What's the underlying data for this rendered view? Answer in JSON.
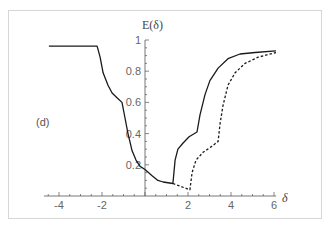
{
  "chart_data": {
    "type": "line",
    "title": "",
    "panel_label": "(d)",
    "xlabel": "δ",
    "ylabel": "E(δ)",
    "xlim": [
      -4.7,
      6.1
    ],
    "ylim": [
      0,
      1
    ],
    "grid": false,
    "legend": null,
    "x_ticks": [
      -4,
      -2,
      2,
      4,
      6
    ],
    "x_tick_labels": [
      "-4",
      "-2",
      "2",
      "4",
      "6"
    ],
    "y_ticks": [
      0.2,
      0.4,
      0.6,
      0.8,
      1
    ],
    "y_tick_labels": [
      "0.2",
      "0.4",
      "0.6",
      "0.8",
      "1"
    ],
    "series": [
      {
        "name": "solid",
        "style": "solid",
        "color": "#1a1a1a",
        "x": [
          -4.47,
          -2.23,
          -2.09,
          -1.95,
          -1.72,
          -1.53,
          -1.3,
          -1.07,
          -0.93,
          -0.79,
          -0.6,
          -0.42,
          -0.23,
          0.0,
          0.33,
          0.6,
          0.84,
          1.3,
          1.4,
          1.53,
          1.77,
          2.05,
          2.42,
          2.56,
          2.79,
          3.02,
          3.4,
          3.86,
          4.42,
          5.12,
          6.09
        ],
        "y": [
          0.96,
          0.96,
          0.89,
          0.79,
          0.71,
          0.66,
          0.63,
          0.6,
          0.5,
          0.4,
          0.29,
          0.23,
          0.19,
          0.17,
          0.13,
          0.1,
          0.09,
          0.08,
          0.23,
          0.3,
          0.34,
          0.38,
          0.41,
          0.52,
          0.65,
          0.74,
          0.82,
          0.88,
          0.91,
          0.92,
          0.93
        ]
      },
      {
        "name": "dashed",
        "style": "dashed",
        "color": "#1a1a1a",
        "x": [
          1.3,
          2.09,
          2.19,
          2.37,
          2.7,
          3.12,
          3.4,
          3.49,
          3.63,
          3.86,
          4.19,
          4.65,
          5.26,
          6.09
        ],
        "y": [
          0.08,
          0.04,
          0.15,
          0.23,
          0.28,
          0.32,
          0.35,
          0.46,
          0.58,
          0.71,
          0.79,
          0.85,
          0.89,
          0.92
        ]
      }
    ]
  }
}
